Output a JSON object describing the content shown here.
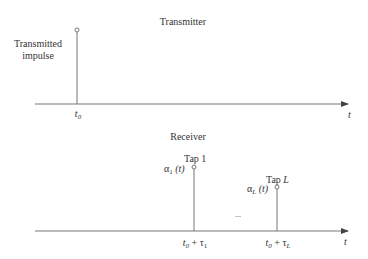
{
  "transmitter": {
    "title": "Transmitter",
    "impulse_label_line1": "Transmitted",
    "impulse_label_line2": "impulse",
    "tick_label_base": "t",
    "tick_label_sub": "0",
    "axis_label": "t"
  },
  "receiver": {
    "title": "Receiver",
    "taps": [
      {
        "name": "Tap 1",
        "gain_base": "α",
        "gain_sub": "1",
        "gain_arg": "(t)",
        "tick_base": "t",
        "tick_sub": "0",
        "tick_plus": " + τ",
        "tick_plus_sub": "1"
      },
      {
        "name": "Tap L",
        "gain_base": "α",
        "gain_sub": "L",
        "gain_arg": "(t)",
        "tick_base": "t",
        "tick_sub": "0",
        "tick_plus": " + τ",
        "tick_plus_sub": "L"
      }
    ],
    "ellipsis": "...",
    "axis_label": "t"
  },
  "colors": {
    "line": "#777777",
    "text": "#333333"
  }
}
